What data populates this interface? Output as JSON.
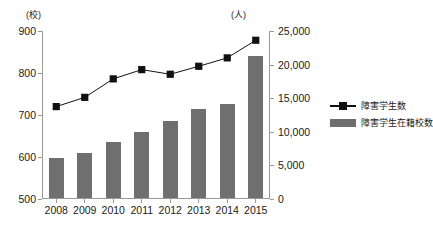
{
  "chart_data": {
    "type": "bar",
    "title": "",
    "subtitle": "",
    "xlabel": "",
    "categories": [
      "2008",
      "2009",
      "2010",
      "2011",
      "2012",
      "2013",
      "2014",
      "2015"
    ],
    "grid": false,
    "legend_position": "right",
    "axes": {
      "left": {
        "unit_label": "(校)",
        "ylabel": "",
        "ylim": [
          500,
          900
        ],
        "ticks": [
          500,
          600,
          700,
          800,
          900
        ],
        "tick_labels": [
          "500",
          "600",
          "700",
          "800",
          "900"
        ]
      },
      "right": {
        "unit_label": "(人)",
        "ylabel": "",
        "ylim": [
          0,
          25000
        ],
        "ticks": [
          0,
          5000,
          10000,
          15000,
          20000,
          25000
        ],
        "tick_labels": [
          "0",
          "5,000",
          "10,000",
          "15,000",
          "20,000",
          "25,000"
        ]
      }
    },
    "series": [
      {
        "name": "障害学生数",
        "type": "line",
        "marker": "square",
        "color": "#111111",
        "axis": "left",
        "values": [
          720,
          742,
          786,
          808,
          797,
          816,
          836,
          878
        ]
      },
      {
        "name": "障害学生在籍校数",
        "type": "bar",
        "color": "#6f6f6f",
        "axis": "right",
        "values": [
          5900,
          6700,
          8300,
          9800,
          11400,
          13300,
          14000,
          21200
        ]
      }
    ]
  },
  "legend": {
    "items": [
      {
        "label": "障害学生数",
        "key": "line-marker-key",
        "color": "#111111"
      },
      {
        "label": "障害学生在籍校数",
        "key": "bar-swatch-key",
        "color": "#6f6f6f"
      }
    ]
  }
}
